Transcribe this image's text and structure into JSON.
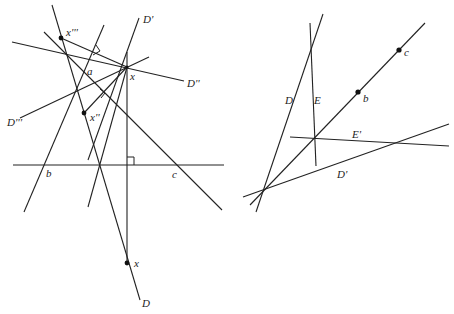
{
  "left_figure": {
    "labels": {
      "D_prime": "D'",
      "D_double_prime": "D''",
      "D_triple_prime": "D'''",
      "D": "D",
      "x_top": "x",
      "x_bottom": "x",
      "x_double_prime": "x''",
      "x_triple_prime": "x'''",
      "a": "a",
      "b": "b",
      "c": "c"
    }
  },
  "right_figure": {
    "labels": {
      "D": "D",
      "E": "E",
      "E_prime": "E'",
      "D_prime": "D'",
      "b": "b",
      "c": "c"
    }
  }
}
